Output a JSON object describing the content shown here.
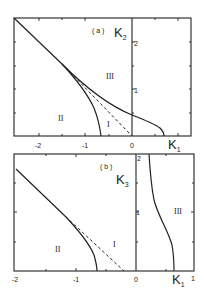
{
  "panels": [
    {
      "id": "a",
      "label": "( a )",
      "x_axis": {
        "name": "K",
        "sub": "1",
        "ticks": [
          "-2",
          "-1",
          "0"
        ]
      },
      "y_axis": {
        "name": "K",
        "sub": "2",
        "ticks": [
          "1",
          "2"
        ]
      },
      "regions": [
        "II",
        "I",
        "III"
      ],
      "curves": [
        {
          "name": "boundary-II-I",
          "style": "solid",
          "description": "from (-2.5,2.5) diagonal bending down to K1≈-0.6 at K2=0"
        },
        {
          "name": "dashed-diagonal",
          "style": "dashed",
          "description": "straight line from (-1.5,1.5) to origin (0,0)"
        },
        {
          "name": "boundary-I-III",
          "style": "solid",
          "description": "from (-1.5,1.5) through (0,0.45) curving to K1≈0.65 at K2=0"
        }
      ]
    },
    {
      "id": "b",
      "label": "( b )",
      "x_axis": {
        "name": "K",
        "sub": "1",
        "ticks": [
          "-2",
          "-1",
          "0",
          "1"
        ]
      },
      "y_axis": {
        "name": "K",
        "sub": "3",
        "ticks": [
          "1",
          "2"
        ]
      },
      "regions": [
        "II",
        "I",
        "III"
      ],
      "curves": [
        {
          "name": "boundary-II-I",
          "style": "solid",
          "description": "from (-2,1.75) diagonal bending down to K1≈-0.65 at K3=0"
        },
        {
          "name": "dashed-diagonal",
          "style": "dashed",
          "description": "straight line from (-1.1,1) to (-0.2,0)"
        },
        {
          "name": "boundary-I-III",
          "style": "solid",
          "description": "near-vertical curve from K1≈0.25 at top to K1≈0.65 at K3=0"
        }
      ]
    }
  ]
}
